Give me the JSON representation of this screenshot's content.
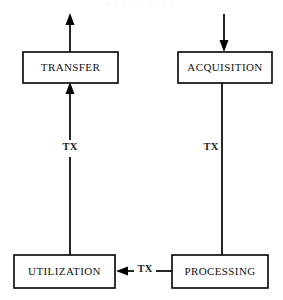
{
  "page": {
    "title_faint": "DATA CYCLE",
    "width": 283,
    "height": 300,
    "background_color": "#ffffff",
    "stroke_color": "#000000",
    "text_color": "#111111"
  },
  "nodes": [
    {
      "id": "transfer",
      "label": "TRANSFER",
      "x": 23,
      "y": 52,
      "width": 95,
      "height": 31,
      "center_x": 70.5,
      "center_y": 67.5
    },
    {
      "id": "acquisition",
      "label": "ACQUISITION",
      "x": 178,
      "y": 52,
      "width": 94,
      "height": 31,
      "center_x": 225,
      "center_y": 67.5
    },
    {
      "id": "utilization",
      "label": "UTILIZATION",
      "x": 14,
      "y": 255,
      "width": 101,
      "height": 33,
      "center_x": 64.5,
      "center_y": 271.5
    },
    {
      "id": "processing",
      "label": "PROCESSING",
      "x": 172,
      "y": 255,
      "width": 96,
      "height": 33,
      "center_x": 220,
      "center_y": 271.5
    }
  ],
  "edges": [
    {
      "id": "transfer-out",
      "from": "transfer",
      "to": "external-out",
      "label": "",
      "direction": "up",
      "x": 70,
      "y_start": 52,
      "y_end": 14
    },
    {
      "id": "external-in-acquisition",
      "from": "external-in",
      "to": "acquisition",
      "label": "",
      "direction": "down",
      "x": 224,
      "y_start": 14,
      "y_end": 52
    },
    {
      "id": "utilization-transfer",
      "from": "utilization",
      "to": "transfer",
      "label": "TX",
      "direction": "up",
      "x": 70,
      "y_start": 255,
      "y_end": 83,
      "label_x": 70,
      "label_y": 148
    },
    {
      "id": "acquisition-processing",
      "from": "acquisition",
      "to": "processing",
      "label": "TX",
      "direction": "down",
      "x": 222,
      "y_start": 83,
      "y_end": 255,
      "label_x": 211,
      "label_y": 148
    },
    {
      "id": "processing-utilization",
      "from": "processing",
      "to": "utilization",
      "label": "TX",
      "direction": "left",
      "y": 271,
      "x_start": 172,
      "x_end": 116,
      "label_x": 144,
      "label_y": 270
    }
  ]
}
